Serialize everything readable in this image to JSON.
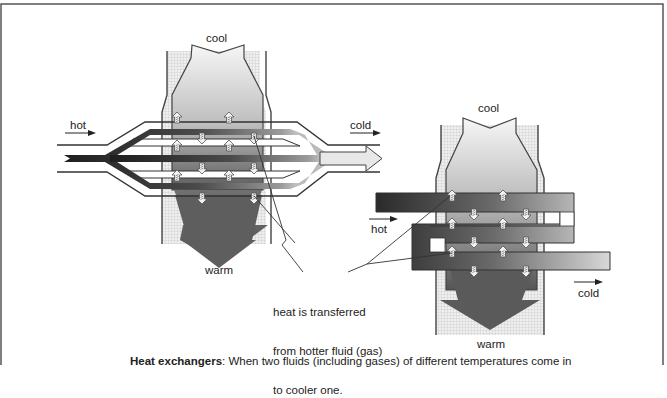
{
  "figure": {
    "left_unit": {
      "top_label": "cool",
      "bottom_label": "warm",
      "inlet_label": "hot",
      "outlet_label": "cold"
    },
    "right_unit": {
      "top_label": "cool",
      "bottom_label": "warm",
      "inlet_label": "hot",
      "outlet_label": "cold"
    },
    "annotation": {
      "line1": "heat is transferred",
      "line2": "from hotter fluid (gas)",
      "line3": "to cooler one."
    },
    "caption": {
      "title": "Heat exchangers",
      "text": ": When two fluids (including gases) of different temperatures come in"
    },
    "colors": {
      "border": "#555555",
      "dark_fluid": "#2a2a2a",
      "mid_gray": "#7a7a7a",
      "light_gray": "#e6e6e6",
      "hatch": "#d8d8d8"
    }
  }
}
